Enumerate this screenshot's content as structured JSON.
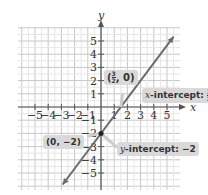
{
  "chart_data": {
    "type": "line",
    "title": "",
    "xlabel": "x",
    "ylabel": "y",
    "xlim": [
      -5.5,
      5.8
    ],
    "ylim": [
      -6,
      6
    ],
    "grid": true,
    "x_ticks": [
      -5,
      -4,
      -3,
      -2,
      -1,
      1,
      2,
      3,
      4,
      5
    ],
    "y_ticks": [
      5,
      4,
      3,
      2,
      1,
      -1,
      -2,
      -3,
      -4,
      -5
    ],
    "series": [
      {
        "name": "y = (4/3)x - 2",
        "slope": 1.3333,
        "intercept": -2,
        "x": [
          -2.9,
          5.5
        ],
        "y": [
          -5.87,
          5.33
        ],
        "color": "#6b6b6b"
      }
    ],
    "points": [
      {
        "x": 0,
        "y": -2,
        "label": "(0, -2)"
      },
      {
        "x": 1.5,
        "y": 0,
        "label": "(3/2, 0)"
      }
    ],
    "annotations": [
      {
        "text": "x-intercept: 3/2",
        "target": [
          1.5,
          0
        ]
      },
      {
        "text": "y-intercept: -2",
        "target": [
          0,
          -2
        ]
      },
      {
        "text": "(3/2, 0)",
        "target": [
          1.5,
          0
        ]
      },
      {
        "text": "(0, -2)",
        "target": [
          0,
          -2
        ]
      }
    ]
  },
  "labels": {
    "x_axis": "x",
    "y_axis": "y",
    "point_xint_prefix": "(",
    "point_xint_num": "3",
    "point_xint_den": "2",
    "point_xint_suffix": ", 0)",
    "point_yint": "(0, −2)",
    "xint_var": "x",
    "xint_text": "-intercept: ",
    "xint_num": "3",
    "xint_den": "2",
    "yint_var": "y",
    "yint_text": "-intercept: −2"
  }
}
